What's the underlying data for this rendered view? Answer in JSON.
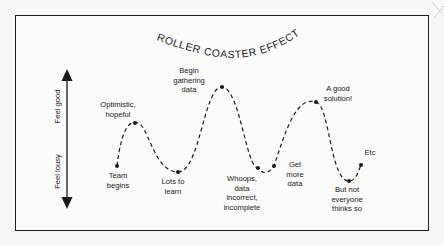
{
  "title": "ROLLER COASTER EFFECT",
  "axis": {
    "top_label": "Feel good",
    "bottom_label": "Feel lousy"
  },
  "points": [
    {
      "label": "Team\nbegins",
      "x": 117,
      "y": 166
    },
    {
      "label": "Optimistic,\nhopeful",
      "x": 135,
      "y": 123
    },
    {
      "label": "Lots to\nlearn",
      "x": 178,
      "y": 172
    },
    {
      "label": "Begin\ngathering\ndata",
      "x": 222,
      "y": 87
    },
    {
      "label": "Whoops,\ndata\nincorrect,\nincomplete",
      "x": 258,
      "y": 168
    },
    {
      "label": "Get\nmore\ndata",
      "x": 274,
      "y": 166
    },
    {
      "label": "A good\nsolution!",
      "x": 316,
      "y": 102
    },
    {
      "label": "But not\neveryone\nthinks so",
      "x": 349,
      "y": 181
    },
    {
      "label": "Etc",
      "x": 361,
      "y": 165
    }
  ],
  "labels": {
    "team_begins": "Team\nbegins",
    "optimistic": "Optimistic,\nhopeful",
    "lots_to_learn": "Lots to\nlearn",
    "begin_gathering": "Begin\ngathering\ndata",
    "whoops": "Whoops,\ndata\nincorrect,\nincomplete",
    "get_more_data": "Get\nmore\ndata",
    "good_solution": "A good\nsolution!",
    "but_not": "But not\neveryone\nthinks so",
    "etc": "Etc"
  },
  "colors": {
    "ink": "#1a1a1a",
    "paper": "#fbfbfa"
  }
}
